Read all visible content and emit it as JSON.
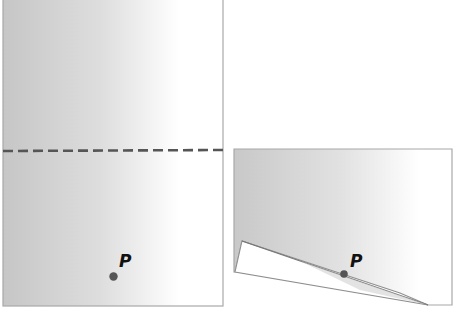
{
  "figure": {
    "colors": {
      "paper_gray_dark": "#c9c9c9",
      "paper_gray_light": "#ffffff",
      "border": "#a8a8a8",
      "dashed_line": "#555555",
      "point": "#555555",
      "label": "#111111",
      "flap": "#ffffff",
      "flap_shadow": "#dcdcdc"
    }
  },
  "left_panel": {
    "label_point": "P",
    "fold_line_style": "dashed"
  },
  "right_panel": {
    "label_point": "P"
  }
}
